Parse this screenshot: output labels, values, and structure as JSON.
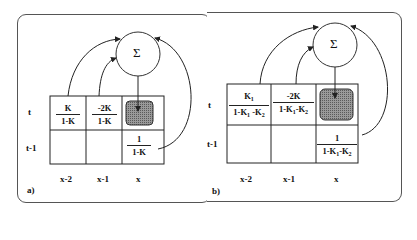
{
  "panels": [
    {
      "label": "a)",
      "summation_symbol": "Σ",
      "row_labels": [
        "t",
        "t-1"
      ],
      "col_labels": [
        "x-2",
        "x-1",
        "x"
      ],
      "cells": {
        "t_x2": {
          "num": "K",
          "den": "1-K"
        },
        "t_x1": {
          "num": "-2K",
          "den": "1-K"
        },
        "t_x": {
          "shaded": true
        },
        "t1_x2": null,
        "t1_x1": null,
        "t1_x": {
          "num": "1",
          "den": "1-K"
        }
      }
    },
    {
      "label": "b)",
      "summation_symbol": "Σ",
      "row_labels": [
        "t",
        "t-1"
      ],
      "col_labels": [
        "x-2",
        "x-1",
        "x"
      ],
      "cells": {
        "t_x2": {
          "num": "K",
          "num_sub": "1",
          "den": "1-K",
          "den_sub1": "1",
          "den_mid": " -K",
          "den_sub2": "2"
        },
        "t_x1": {
          "num": "-2K",
          "den": "1-K",
          "den_sub1": "1",
          "den_mid": "-K",
          "den_sub2": "2"
        },
        "t_x": {
          "shaded": true
        },
        "t1_x2": null,
        "t1_x1": null,
        "t1_x": {
          "num": "1",
          "den": "1-K",
          "den_sub1": "1",
          "den_mid": "-K",
          "den_sub2": "2"
        }
      }
    }
  ],
  "colors": {
    "shade": "#8a8a8a",
    "line": "#222222",
    "panel_border": "#555555"
  }
}
